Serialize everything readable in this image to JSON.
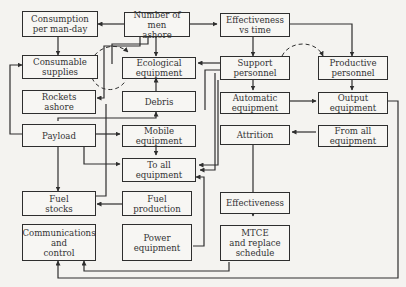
{
  "diagram": {
    "colors": {
      "line": "#2e2e2e",
      "box_fill": "#f7f6f3",
      "background": "#f4f3f0",
      "text": "#333333"
    },
    "nodes": [
      {
        "id": "consumption",
        "label": "Consumption\nper man-day"
      },
      {
        "id": "men_ashore",
        "label": "Number of men\nashore"
      },
      {
        "id": "effectiveness_time",
        "label": "Effectiveness\nvs time"
      },
      {
        "id": "consumable",
        "label": "Consumable\nsupplies"
      },
      {
        "id": "ecological",
        "label": "Ecological\nequipment"
      },
      {
        "id": "support",
        "label": "Support\npersonnel"
      },
      {
        "id": "productive",
        "label": "Productive\npersonnel"
      },
      {
        "id": "rockets",
        "label": "Rockets\nashore"
      },
      {
        "id": "debris",
        "label": "Debris"
      },
      {
        "id": "automatic",
        "label": "Automatic\nequipment"
      },
      {
        "id": "output",
        "label": "Output\nequipment"
      },
      {
        "id": "payload",
        "label": "Payload"
      },
      {
        "id": "mobile",
        "label": "Mobile\nequipment"
      },
      {
        "id": "attrition",
        "label": "Attrition"
      },
      {
        "id": "from_all",
        "label": "From all\nequipment"
      },
      {
        "id": "to_all",
        "label": "To all\nequipment"
      },
      {
        "id": "fuel_stocks",
        "label": "Fuel\nstocks"
      },
      {
        "id": "fuel_production",
        "label": "Fuel\nproduction"
      },
      {
        "id": "effectiveness",
        "label": "Effectiveness"
      },
      {
        "id": "comms",
        "label": "Communications\nand\ncontrol"
      },
      {
        "id": "power",
        "label": "Power\nequipment"
      },
      {
        "id": "mtce",
        "label": "MTCE\nand replace\nschedule"
      }
    ]
  }
}
